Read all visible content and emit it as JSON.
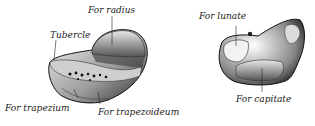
{
  "figure": {
    "left_bone": {
      "labels": {
        "for_radius": "For radius",
        "tubercle": "Tubercle",
        "for_trapezium": "For trapezium",
        "for_trapezoideum": "For trapezoideum"
      }
    },
    "right_bone": {
      "labels": {
        "for_lunate": "For lunate",
        "for_capitate": "For capitate"
      }
    }
  }
}
